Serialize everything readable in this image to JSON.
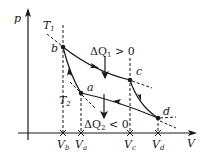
{
  "diagram": {
    "type": "Carnot cycle p-V diagram",
    "axes": {
      "y_label": "p",
      "x_label": "V"
    },
    "isotherms": [
      {
        "label": "T",
        "subscript": "1"
      },
      {
        "label": "T",
        "subscript": "2"
      }
    ],
    "points": [
      {
        "id": "a",
        "label": "a"
      },
      {
        "id": "b",
        "label": "b"
      },
      {
        "id": "c",
        "label": "c"
      },
      {
        "id": "d",
        "label": "d"
      }
    ],
    "volume_ticks": [
      {
        "label": "V",
        "subscript": "b"
      },
      {
        "label": "V",
        "subscript": "a"
      },
      {
        "label": "V",
        "subscript": "c"
      },
      {
        "label": "V",
        "subscript": "d"
      }
    ],
    "heat_labels": {
      "q1": {
        "prefix": "ΔQ",
        "subscript": "1",
        "relation": " > 0"
      },
      "q2": {
        "prefix": "ΔQ",
        "subscript": "2",
        "relation": " < 0"
      }
    },
    "colors": {
      "line": "#1a1a1a",
      "background": "#ffffff"
    }
  }
}
